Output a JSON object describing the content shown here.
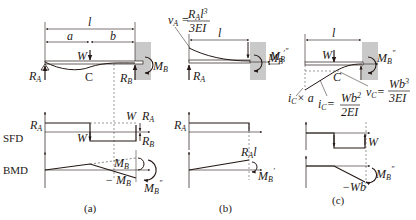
{
  "colors": {
    "ink": "#231815",
    "wall": "#c9c9c9",
    "dashed": "#555555"
  },
  "row_labels": {
    "sfd": "SFD",
    "bmd": "BMD"
  },
  "panel_a": {
    "caption": "(a)",
    "dim_l": "l",
    "dim_a": "a",
    "dim_b": "b",
    "load": "W",
    "point_c": "C",
    "reaction_a": "R",
    "reaction_a_sub": "A",
    "reaction_b": "R",
    "reaction_b_sub": "B",
    "moment_b": "M",
    "moment_b_sub": "B",
    "sfd": {
      "ra": "R",
      "ra_sub": "A",
      "w_down": "W",
      "w_top": "W",
      "ra_right": "R",
      "ra_right_sub": "A",
      "rb": "R",
      "rb_sub": "B"
    },
    "bmd": {
      "mb_prime": "M",
      "mb_prime_sub": "B",
      "mb_prime_mark": "′",
      "neg_mb": "− M",
      "neg_mb_sub": "B",
      "mb_dprime": "M",
      "mb_dprime_sub": "B",
      "mb_dprime_mark": "″"
    }
  },
  "panel_b": {
    "caption": "(b)",
    "dim_l": "l",
    "deflection_lhs": "v",
    "deflection_lhs_sub": "A",
    "deflection_num": "R",
    "deflection_num_sub": "A",
    "deflection_num_tail": "l",
    "deflection_num_exp": "3",
    "deflection_den": "3EI",
    "reaction_a": "R",
    "reaction_a_sub": "A",
    "moment_b": "M",
    "moment_b_sub": "B",
    "moment_b_mark": "′",
    "sfd": {
      "ra": "R",
      "ra_sub": "A"
    },
    "bmd": {
      "ral": "R",
      "ral_sub": "A",
      "ral_tail": "l",
      "mb": "M",
      "mb_sub": "B",
      "mb_mark": "′"
    }
  },
  "panel_c": {
    "caption": "(c)",
    "dim_l": "l",
    "load": "W",
    "point_c": "C",
    "moment_left": "M",
    "moment_left_sub": "B",
    "moment_left_mark": "″",
    "moment_b": "M",
    "moment_b_sub": "B",
    "moment_b_mark": "″",
    "ic_times_a": "i",
    "ic_times_a_sub": "C",
    "ic_times_a_tail": "× a",
    "ic_lhs": "i",
    "ic_lhs_sub": "C",
    "ic_num": "Wb",
    "ic_num_exp": "2",
    "ic_den": "2EI",
    "vc_lhs": "v",
    "vc_lhs_sub": "C",
    "vc_num": "Wb",
    "vc_num_exp": "3",
    "vc_den": "3EI",
    "sfd": {
      "w": "W"
    },
    "bmd": {
      "neg_wb": "−Wb",
      "mb": "M",
      "mb_sub": "B",
      "mb_mark": "″"
    }
  }
}
